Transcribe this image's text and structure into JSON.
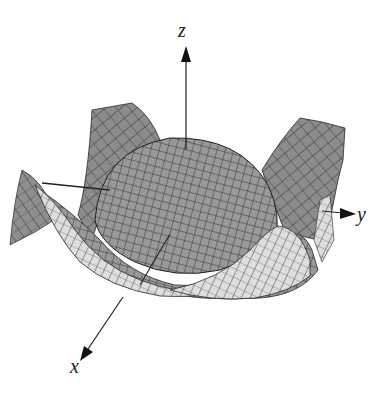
{
  "figure": {
    "type": "3d-surface-plot",
    "axes": {
      "x": {
        "label": "x"
      },
      "y": {
        "label": "y"
      },
      "z": {
        "label": "z"
      }
    },
    "colors": {
      "surface_dark": "#8a8a8a",
      "surface_mid": "#a0a0a0",
      "surface_light": "#d9d9d9",
      "mesh_lines": "#2a2a2a",
      "axis": "#222222",
      "background": "#ffffff"
    }
  }
}
